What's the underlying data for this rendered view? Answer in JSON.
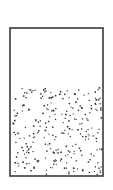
{
  "canvas": {
    "width": 113,
    "height": 190,
    "background": "#ffffff"
  },
  "container": {
    "x": 10,
    "y": 28,
    "width": 93,
    "height": 148,
    "stroke": "#3a3a3a",
    "stroke_width": 1.6,
    "fill": "#ffffff"
  },
  "particles": {
    "region": {
      "x": 11,
      "y": 86,
      "width": 91,
      "height": 89
    },
    "count": 260,
    "seed": 7,
    "color": "#2b2b2b",
    "size_min": 1.0,
    "size_max": 1.6
  },
  "empty_region": {
    "x": 11,
    "y": 29,
    "width": 91,
    "height": 57,
    "description": "empty headspace above particles"
  }
}
